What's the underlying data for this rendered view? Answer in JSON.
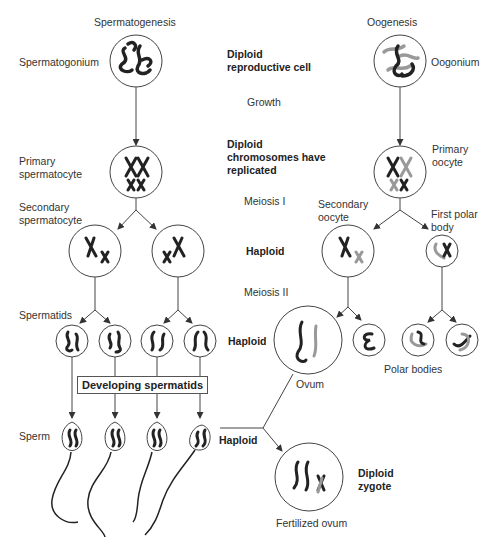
{
  "headers": {
    "left": "Spermatogenesis",
    "right": "Oogenesis"
  },
  "left_labels": {
    "spermatogonium": "Spermatogonium",
    "primary_1": "Primary",
    "primary_2": "spermatocyte",
    "secondary_1": "Secondary",
    "secondary_2": "spermatocyte",
    "spermatids": "Spermatids",
    "sperm": "Sperm"
  },
  "right_labels": {
    "oogonium": "Oogonium",
    "primary_1": "Primary",
    "primary_2": "oocyte",
    "secondary_1": "Secondary",
    "secondary_2": "oocyte",
    "polar_1": "First polar",
    "polar_2": "body",
    "ovum": "Ovum",
    "polar_bodies": "Polar bodies",
    "fertilized": "Fertilized ovum"
  },
  "center_labels": {
    "diploid_repro_1": "Diploid",
    "diploid_repro_2": "reproductive cell",
    "growth": "Growth",
    "diploid_rep_1": "Diploid",
    "diploid_rep_2": "chromosomes have",
    "diploid_rep_3": "replicated",
    "meiosis1": "Meiosis I",
    "haploid1": "Haploid",
    "meiosis2": "Meiosis II",
    "haploid2": "Haploid",
    "haploid3": "Haploid",
    "zygote_1": "Diploid",
    "zygote_2": "zygote"
  },
  "developing_box": "Developing spermatids",
  "colors": {
    "line": "#444444",
    "chromosome_dark": "#222222",
    "chromosome_light": "#999999"
  }
}
